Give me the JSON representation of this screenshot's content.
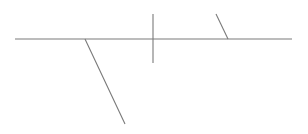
{
  "diagram": {
    "width": 308,
    "height": 134,
    "background": "#ffffff",
    "stroke_color": "#7a7a7a",
    "segments": [
      {
        "name": "baseline",
        "x1": 15,
        "y1": 39,
        "x2": 292,
        "y2": 39
      },
      {
        "name": "divider-vertical",
        "x1": 153,
        "y1": 14,
        "x2": 153,
        "y2": 63
      },
      {
        "name": "slant-upper-right",
        "x1": 216,
        "y1": 14,
        "x2": 228,
        "y2": 39
      },
      {
        "name": "slant-lower-left",
        "x1": 85,
        "y1": 39,
        "x2": 125,
        "y2": 124
      }
    ]
  }
}
